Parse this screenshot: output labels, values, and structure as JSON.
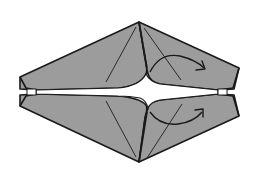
{
  "diagram": {
    "type": "origami-fold-step",
    "description": "Hexagonal folded paper model with a central horizontal slit; two curved arrows indicate folding the right-hand flaps outward",
    "colors": {
      "paper": "#9c9c9c",
      "outline": "#1a1a1a",
      "background": "#ffffff"
    },
    "arrows": [
      {
        "name": "upper-fold-arrow",
        "direction": "right",
        "position": "upper-right flap"
      },
      {
        "name": "lower-fold-arrow",
        "direction": "right",
        "position": "lower-right flap"
      }
    ]
  }
}
